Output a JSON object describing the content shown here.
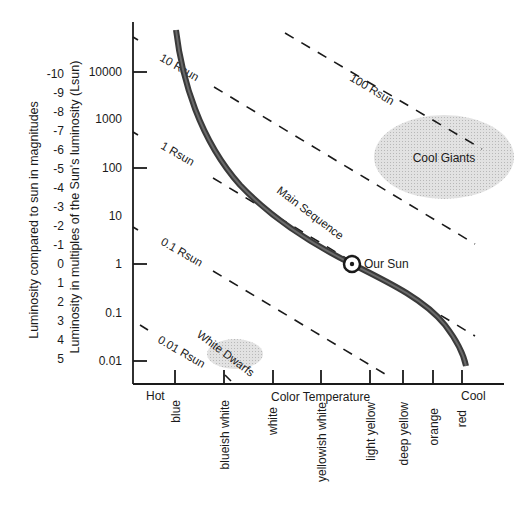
{
  "diagram": {
    "y_axis_magnitude_label": "Luminosity compared to sun in magnitudes",
    "y_axis_luminosity_label": "Luminosity in multiples of the Sun's luminosity (Lsun)",
    "x_axis_label": "Color Temperature",
    "x_axis_hot": "Hot",
    "x_axis_cool": "Cool",
    "magnitudes": [
      "-10",
      "-9",
      "-8",
      "-7",
      "-6",
      "-5",
      "-4",
      "-3",
      "-2",
      "-1",
      "0",
      "1",
      "2",
      "3",
      "4",
      "5"
    ],
    "luminosities": [
      "10000",
      "1000",
      "100",
      "10",
      "1",
      "0.1",
      "0.01"
    ],
    "colors": [
      "blue",
      "blueish white",
      "white",
      "yellowish white",
      "light yellow",
      "deep yellow",
      "orange",
      "red"
    ],
    "radius_lines": [
      "100 Rsun",
      "10 Rsun",
      "1 Rsun",
      "0.1 Rsun",
      "0.01 Rsun"
    ],
    "regions": {
      "main_sequence": "Main Sequence",
      "cool_giants": "Cool Giants",
      "white_dwarfs": "White Dwarfs",
      "our_sun": "Our Sun"
    },
    "style": {
      "line_color": "#1a1a1a",
      "curve_color": "#444444",
      "region_fill": "#d9d9d9"
    }
  }
}
